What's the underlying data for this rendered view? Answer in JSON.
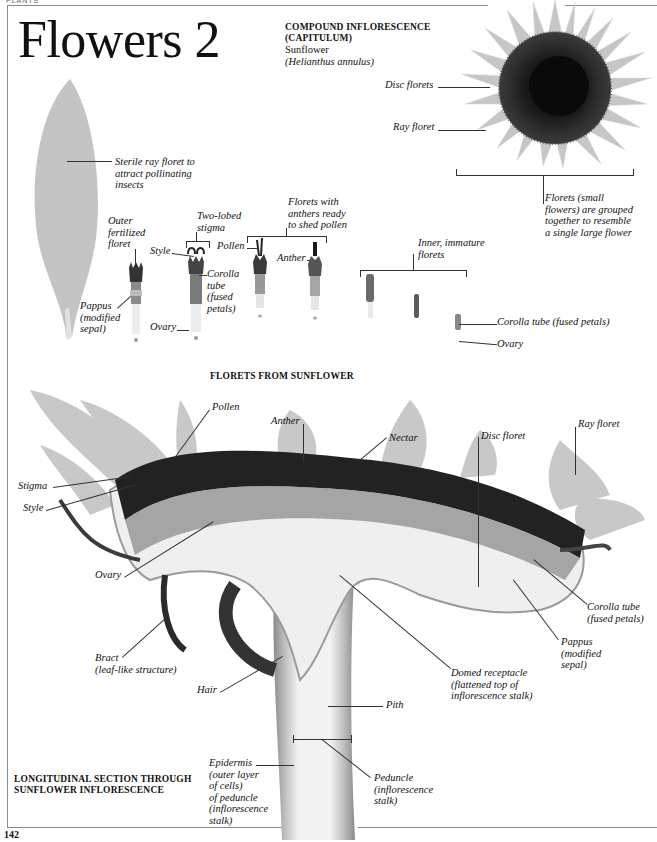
{
  "page": {
    "running_head": "PLANTS",
    "title": "Flowers 2",
    "page_number": "142"
  },
  "capitulum": {
    "heading_line1": "COMPOUND INFLORESCENCE",
    "heading_line2": "(CAPITULUM)",
    "common_name": "Sunflower",
    "latin_name": "(Helianthus annulus)",
    "labels": {
      "disc_florets": "Disc florets",
      "ray_floret": "Ray floret",
      "grouped_line1": "Florets (small",
      "grouped_line2": "flowers) are grouped",
      "grouped_line3": "together to resemble",
      "grouped_line4": "a single large flower"
    }
  },
  "florets_section": {
    "caption": "FLORETS FROM SUNFLOWER",
    "labels": {
      "sterile_line1": "Sterile ray floret to",
      "sterile_line2": "attract pollinating",
      "sterile_line3": "insects",
      "outer_line1": "Outer",
      "outer_line2": "fertilized",
      "outer_line3": "floret",
      "pappus_line1": "Pappus",
      "pappus_line2": "(modified",
      "pappus_line3": "sepal)",
      "two_lobed_line1": "Two-lobed",
      "two_lobed_line2": "stigma",
      "style": "Style",
      "corolla_line1": "Corolla",
      "corolla_line2": "tube",
      "corolla_line3": "(fused",
      "corolla_line4": "petals)",
      "ovary": "Ovary",
      "anthers_line1": "Florets with",
      "anthers_line2": "anthers ready",
      "anthers_line3": "to shed pollen",
      "pollen": "Pollen",
      "anther": "Anther",
      "inner_line1": "Inner, immature",
      "inner_line2": "florets",
      "corolla_tube_full": "Corolla tube (fused petals)",
      "ovary_right": "Ovary"
    }
  },
  "section_view": {
    "caption_line1": "LONGITUDINAL SECTION THROUGH",
    "caption_line2": "SUNFLOWER INFLORESCENCE",
    "labels": {
      "pollen": "Pollen",
      "anther": "Anther",
      "nectar": "Nectar",
      "disc_floret": "Disc floret",
      "ray_floret": "Ray floret",
      "stigma": "Stigma",
      "style": "Style",
      "ovary": "Ovary",
      "corolla_line1": "Corolla tube",
      "corolla_line2": "(fused petals)",
      "pappus_line1": "Pappus",
      "pappus_line2": "(modified",
      "pappus_line3": "sepal)",
      "bract_line1": "Bract",
      "bract_line2": "(leaf-like structure)",
      "hair": "Hair",
      "domed_line1": "Domed receptacle",
      "domed_line2": "(flattened top of",
      "domed_line3": "inflorescence stalk)",
      "pith": "Pith",
      "epidermis_line1": "Epidermis",
      "epidermis_line2": "(outer layer",
      "epidermis_line3": "of cells)",
      "epidermis_line4": "of peduncle",
      "epidermis_line5": "(inflorescence",
      "epidermis_line6": "stalk)",
      "peduncle_line1": "Peduncle",
      "peduncle_line2": "(inflorescence",
      "peduncle_line3": "stalk)"
    }
  },
  "colors": {
    "frame": "#8a8a8a",
    "ray_petal": "#c9c9c9",
    "disc_dark": "#1e1e1e",
    "leader": "#333333"
  }
}
